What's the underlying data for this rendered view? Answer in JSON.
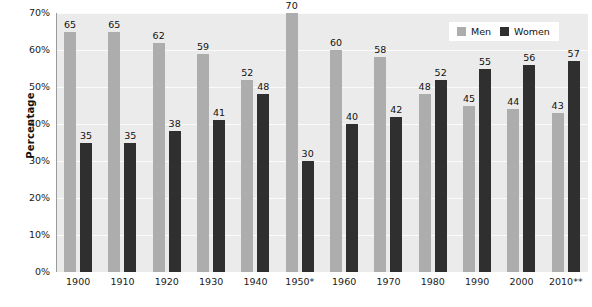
{
  "chart_data": {
    "type": "bar",
    "title": "",
    "subtitle": "",
    "xlabel": "",
    "ylabel": "Percentage",
    "ylim": [
      0,
      70
    ],
    "ytick_labels": [
      "0%",
      "10%",
      "20%",
      "30%",
      "40%",
      "50%",
      "60%",
      "70%"
    ],
    "ytick_values": [
      0,
      10,
      20,
      30,
      40,
      50,
      60,
      70
    ],
    "grid": true,
    "legend_position": "top-right",
    "categories": [
      "1900",
      "1910",
      "1920",
      "1930",
      "1940",
      "1950*",
      "1960",
      "1970",
      "1980",
      "1990",
      "2000",
      "2010**"
    ],
    "series": [
      {
        "name": "Men",
        "color": "#adadad",
        "values": [
          65,
          65,
          62,
          59,
          52,
          70,
          60,
          58,
          48,
          45,
          44,
          43
        ]
      },
      {
        "name": "Women",
        "color": "#2f2f2f",
        "values": [
          35,
          35,
          38,
          41,
          48,
          30,
          40,
          42,
          52,
          55,
          56,
          57
        ]
      }
    ]
  },
  "legend": {
    "items": [
      {
        "label": "Men",
        "swatch": "men"
      },
      {
        "label": "Women",
        "swatch": "women"
      }
    ]
  },
  "colors": {
    "men": "#adadad",
    "women": "#2f2f2f",
    "plot_background": "#ebebeb",
    "gridline": "#fbfbfb",
    "axis": "#9a9a9a",
    "text": "#111111"
  }
}
